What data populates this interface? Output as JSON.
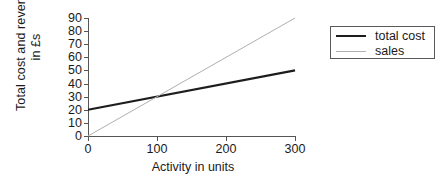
{
  "chart_data": {
    "type": "line",
    "title": "",
    "xlabel": "Activity in units",
    "ylabel_line1": "Total cost and revenue",
    "ylabel_line2": "in £s",
    "xlim": [
      0,
      300
    ],
    "ylim": [
      0,
      90
    ],
    "xticks": [
      0,
      100,
      200,
      300
    ],
    "xtick_labels": [
      "0",
      "100",
      "200",
      "300"
    ],
    "yticks": [
      0,
      10,
      20,
      30,
      40,
      50,
      60,
      70,
      80,
      90
    ],
    "ytick_labels": [
      "0",
      "10",
      "20",
      "30",
      "40",
      "50",
      "60",
      "70",
      "80",
      "90"
    ],
    "grid": false,
    "legend_position": "right",
    "series": [
      {
        "name": "total cost",
        "color": "#1d1d1d",
        "width": 2.2,
        "x": [
          0,
          300
        ],
        "values": [
          20,
          50
        ]
      },
      {
        "name": "sales",
        "color": "#b0b0b0",
        "width": 1,
        "x": [
          0,
          300
        ],
        "values": [
          0,
          90
        ]
      }
    ],
    "annotations": {
      "breakeven_units": 100,
      "breakeven_value": 30
    }
  },
  "legend": {
    "items": [
      {
        "label": "total cost"
      },
      {
        "label": "sales"
      }
    ]
  },
  "colors": {
    "total_cost": "#1d1d1d",
    "sales": "#b0b0b0",
    "axis": "#555555",
    "background": "#ffffff"
  }
}
